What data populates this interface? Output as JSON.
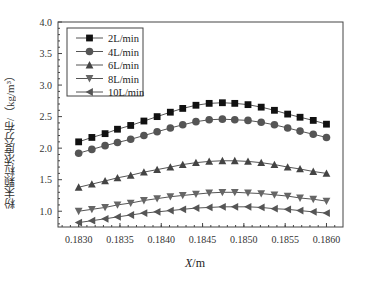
{
  "chart_data": {
    "type": "line",
    "title": "",
    "xlabel": "X/m",
    "ylabel": "粉末颗粒浓度分布/（kg/m³）",
    "xlim": [
      0.18275,
      0.1862
    ],
    "ylim": [
      0.75,
      4.0
    ],
    "x_ticks": [
      "0.1830",
      "0.1835",
      "0.1840",
      "0.1845",
      "0.1850",
      "0.1855",
      "0.1860"
    ],
    "y_ticks": [
      "1.0",
      "1.5",
      "2.0",
      "2.5",
      "3.0",
      "3.5",
      "4.0"
    ],
    "grid": false,
    "legend_position": "upper left",
    "x": [
      0.183,
      0.18316,
      0.18332,
      0.18347,
      0.18363,
      0.18379,
      0.18395,
      0.18411,
      0.18426,
      0.18442,
      0.18458,
      0.18474,
      0.18489,
      0.18505,
      0.18521,
      0.18537,
      0.18553,
      0.18568,
      0.18584,
      0.186
    ],
    "series": [
      {
        "name": "2L/min",
        "marker": "square",
        "values": [
          2.1,
          2.17,
          2.23,
          2.3,
          2.36,
          2.43,
          2.5,
          2.57,
          2.63,
          2.68,
          2.71,
          2.72,
          2.71,
          2.69,
          2.65,
          2.6,
          2.54,
          2.49,
          2.44,
          2.38
        ]
      },
      {
        "name": "4L/min",
        "marker": "circle",
        "values": [
          1.92,
          1.98,
          2.04,
          2.09,
          2.14,
          2.2,
          2.26,
          2.32,
          2.37,
          2.42,
          2.45,
          2.46,
          2.45,
          2.44,
          2.41,
          2.37,
          2.32,
          2.27,
          2.22,
          2.17
        ]
      },
      {
        "name": "6L/min",
        "marker": "triangle-up",
        "values": [
          1.38,
          1.43,
          1.48,
          1.53,
          1.57,
          1.62,
          1.66,
          1.7,
          1.74,
          1.77,
          1.79,
          1.8,
          1.8,
          1.79,
          1.77,
          1.74,
          1.7,
          1.67,
          1.63,
          1.6
        ]
      },
      {
        "name": "8L/min",
        "marker": "triangle-down",
        "values": [
          1.0,
          1.03,
          1.06,
          1.1,
          1.13,
          1.17,
          1.2,
          1.23,
          1.25,
          1.27,
          1.29,
          1.3,
          1.3,
          1.29,
          1.28,
          1.26,
          1.24,
          1.21,
          1.19,
          1.16
        ]
      },
      {
        "name": "10L/min",
        "marker": "triangle-left",
        "values": [
          0.82,
          0.85,
          0.88,
          0.91,
          0.94,
          0.97,
          0.99,
          1.01,
          1.03,
          1.05,
          1.06,
          1.07,
          1.07,
          1.07,
          1.06,
          1.04,
          1.03,
          1.01,
          0.99,
          0.97
        ]
      }
    ]
  },
  "colors": {
    "axis": "#444444",
    "2L/min": "#111111",
    "4L/min": "#555555",
    "6L/min": "#444444",
    "8L/min": "#666666",
    "10L/min": "#555555",
    "line": "#555555"
  }
}
